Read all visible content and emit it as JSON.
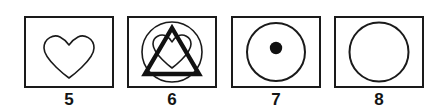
{
  "figure": {
    "background_color": "#ffffff",
    "stroke_color": "#1a1a1a",
    "fill_color": "#111111",
    "panel_count": 4,
    "panels": [
      {
        "label": "5",
        "shapes": "heart-outline",
        "shape_names": [
          "heart"
        ],
        "description": "Heart outline, thin stroke, centered in frame"
      },
      {
        "label": "6",
        "shapes": "circle-triangle-heart-overlap",
        "shape_names": [
          "circle",
          "triangle",
          "heart"
        ],
        "description": "Circle, thick triangle and heart overlapping, centered in frame"
      },
      {
        "label": "7",
        "shapes": "circle-with-filled-dot",
        "shape_names": [
          "circle",
          "dot"
        ],
        "description": "Circle outline with small filled black dot at center"
      },
      {
        "label": "8",
        "shapes": "circle-outline",
        "shape_names": [
          "circle"
        ],
        "description": "Plain circle outline centered in frame"
      }
    ]
  }
}
